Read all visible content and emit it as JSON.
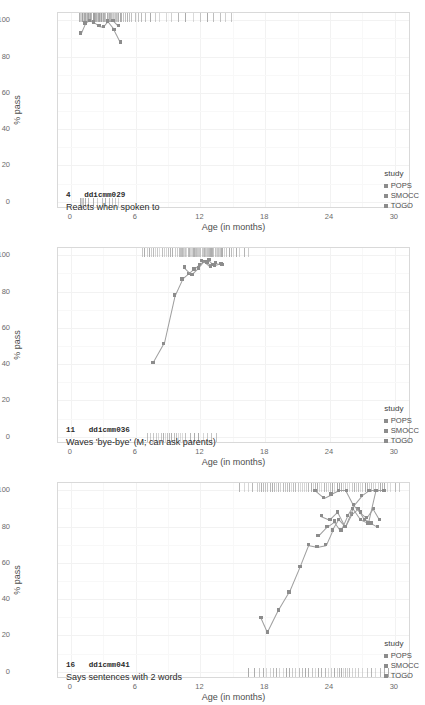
{
  "axes": {
    "ylabel": "% pass",
    "xlabel": "Age (in months)",
    "yticks": [
      "0",
      "20",
      "40",
      "60",
      "80",
      "100"
    ],
    "xticks": [
      "0",
      "6",
      "12",
      "18",
      "24",
      "30"
    ],
    "ylim": [
      -4,
      104
    ],
    "xlim": [
      -1.2,
      31.5
    ]
  },
  "legend": {
    "title": "study",
    "items": [
      {
        "label": "POPS",
        "color": "#8c8c8c"
      },
      {
        "label": "SMOCC",
        "color": "#8c8c8c"
      },
      {
        "label": "TOGO",
        "color": "#8c8c8c"
      }
    ]
  },
  "chart_data": {
    "type": "line",
    "title": "",
    "xlabel": "Age (in months)",
    "ylabel": "% pass",
    "xlim": [
      -1.2,
      31.5
    ],
    "ylim": [
      -4,
      104
    ],
    "grid": true,
    "legend_position": "bottom-right",
    "panels": [
      {
        "number": "4",
        "code": "ddicmm029",
        "description": "Reacts when spoken to",
        "series": [
          {
            "name": "SMOCC",
            "x": [
              0.9,
              1.3,
              1.7,
              2.1,
              2.6,
              3.0,
              3.4,
              3.9,
              4.4
            ],
            "y": [
              93.0,
              98.5,
              100.0,
              99.0,
              97.0,
              96.5,
              99.5,
              100.0,
              97.0
            ]
          },
          {
            "name": "SMOCC",
            "x": [
              3.4,
              4.0,
              4.6
            ],
            "y": [
              99.5,
              95.0,
              88.0
            ]
          }
        ],
        "rug_top": [
          0.7,
          0.8,
          0.9,
          1.0,
          1.0,
          1.1,
          1.2,
          1.2,
          1.3,
          1.3,
          1.4,
          1.5,
          1.5,
          1.6,
          1.6,
          1.7,
          1.8,
          1.8,
          1.9,
          2.0,
          2.0,
          2.1,
          2.1,
          2.2,
          2.3,
          2.3,
          2.4,
          2.5,
          2.5,
          2.6,
          2.6,
          2.7,
          2.8,
          2.8,
          2.9,
          3.0,
          3.0,
          3.1,
          3.1,
          3.2,
          3.3,
          3.3,
          3.4,
          3.5,
          3.5,
          3.6,
          3.7,
          3.8,
          3.9,
          4.0,
          4.1,
          4.2,
          4.3,
          4.4,
          4.5,
          4.6,
          4.8,
          5.0,
          5.2,
          5.4,
          5.6,
          5.9,
          6.2,
          6.5,
          6.9,
          7.3,
          7.8,
          8.2,
          8.8,
          9.3,
          9.9,
          10.6,
          11.3,
          12.0,
          12.6,
          13.2,
          13.8,
          14.3,
          14.8
        ],
        "rug_bottom": [
          0.8,
          0.9,
          1.0,
          1.1,
          1.3,
          1.6,
          2.0,
          2.4,
          2.9,
          3.2,
          3.5,
          3.8,
          4.1,
          4.4
        ]
      },
      {
        "number": "11",
        "code": "ddicmm036",
        "description": "Waves 'bye-bye' (M; can ask parents)",
        "series": [
          {
            "name": "SMOCC",
            "x": [
              7.6,
              8.6,
              9.6,
              10.3,
              10.9,
              11.4,
              11.9,
              12.4,
              12.9,
              13.4,
              14.0
            ],
            "y": [
              41.0,
              51.5,
              78.0,
              87.0,
              90.0,
              92.5,
              95.0,
              96.5,
              94.0,
              96.0,
              95.0
            ]
          },
          {
            "name": "SMOCC",
            "x": [
              10.5,
              11.2,
              11.8,
              12.3,
              12.8,
              13.3,
              13.9
            ],
            "y": [
              93.5,
              89.5,
              93.0,
              96.5,
              97.5,
              94.5,
              95.5
            ]
          },
          {
            "name": "SMOCC",
            "x": [
              12.1,
              12.6,
              13.1
            ],
            "y": [
              97.0,
              96.0,
              95.0
            ]
          }
        ],
        "rug_top": [
          6.6,
          6.8,
          7.0,
          7.2,
          7.4,
          7.6,
          7.8,
          8.0,
          8.2,
          8.4,
          8.6,
          8.8,
          9.0,
          9.2,
          9.4,
          9.6,
          9.8,
          10.0,
          10.1,
          10.2,
          10.3,
          10.4,
          10.5,
          10.6,
          10.7,
          10.8,
          10.9,
          11.0,
          11.1,
          11.2,
          11.3,
          11.4,
          11.5,
          11.6,
          11.7,
          11.8,
          11.9,
          12.0,
          12.1,
          12.2,
          12.3,
          12.4,
          12.5,
          12.6,
          12.7,
          12.8,
          12.9,
          13.0,
          13.1,
          13.2,
          13.3,
          13.4,
          13.5,
          13.6,
          13.7,
          13.8,
          13.9,
          14.0,
          14.2,
          14.4,
          14.6,
          14.8,
          15.0,
          15.3,
          15.6,
          16.0,
          16.4
        ],
        "rug_bottom": [
          7.0,
          7.3,
          7.6,
          7.9,
          8.1,
          8.3,
          8.5,
          8.7,
          8.9,
          9.1,
          9.3,
          9.5,
          9.7,
          9.9,
          10.1,
          10.3,
          10.6,
          11.0,
          11.4,
          11.8,
          12.2,
          12.6,
          13.0,
          13.4
        ]
      },
      {
        "number": "16",
        "code": "ddicmm041",
        "description": "Says sentences with 2 words",
        "series": [
          {
            "name": "SMOCC",
            "x": [
              17.6,
              18.2,
              19.2,
              20.2,
              21.2,
              22.0,
              22.8,
              23.6,
              24.2,
              24.8,
              25.4,
              26.0,
              26.6,
              27.2,
              27.8,
              28.4
            ],
            "y": [
              30.0,
              22.0,
              34.0,
              44.0,
              58.0,
              70.0,
              69.0,
              70.0,
              78.0,
              84.0,
              80.0,
              87.0,
              90.0,
              84.0,
              82.0,
              80.0
            ]
          },
          {
            "name": "POPS",
            "x": [
              22.9,
              23.7,
              24.4,
              25.0,
              25.6,
              26.2,
              26.8,
              27.4,
              28.0,
              28.6
            ],
            "y": [
              75.0,
              80.0,
              83.0,
              78.0,
              86.0,
              92.0,
              88.0,
              85.0,
              90.0,
              84.0
            ]
          },
          {
            "name": "TOGO",
            "x": [
              22.6,
              23.4,
              24.1,
              24.8,
              25.5,
              26.2,
              26.9,
              27.6,
              28.3,
              29.0
            ],
            "y": [
              100.0,
              96.0,
              98.0,
              100.0,
              100.0,
              92.0,
              97.0,
              100.0,
              100.0,
              100.0
            ]
          },
          {
            "name": "TOGO",
            "x": [
              23.2,
              24.0,
              24.7,
              25.4,
              26.1,
              26.8,
              27.5,
              28.2
            ],
            "y": [
              86.0,
              84.0,
              88.0,
              80.0,
              90.0,
              84.0,
              82.0,
              100.0
            ]
          }
        ],
        "rug_top": [
          15.6,
          16.0,
          16.4,
          16.8,
          17.2,
          17.4,
          17.6,
          17.8,
          18.0,
          18.2,
          18.4,
          18.6,
          18.8,
          19.0,
          19.2,
          19.4,
          19.6,
          19.8,
          20.0,
          20.2,
          20.4,
          20.6,
          20.8,
          21.0,
          21.2,
          21.4,
          21.6,
          21.8,
          22.0,
          22.2,
          22.4,
          22.6,
          22.8,
          23.0,
          23.2,
          23.4,
          23.6,
          23.8,
          24.0,
          24.2,
          24.4,
          24.6,
          24.8,
          25.0,
          25.2,
          25.4,
          25.6,
          25.8,
          26.0,
          26.2,
          26.4,
          26.6,
          26.8,
          27.0,
          27.2,
          27.4,
          27.6,
          27.8,
          28.0,
          28.2,
          28.4,
          28.6,
          28.8,
          29.0,
          29.3,
          29.6,
          30.0,
          30.4
        ],
        "rug_bottom": [
          16.4,
          17.0,
          17.4,
          17.8,
          18.1,
          18.4,
          18.7,
          19.0,
          19.3,
          19.6,
          19.9,
          20.2,
          20.5,
          20.8,
          21.1,
          21.4,
          21.7,
          22.0,
          22.3,
          22.6,
          22.9,
          23.2,
          23.5,
          23.8,
          24.1,
          24.4,
          24.6,
          24.8,
          25.0,
          25.2,
          25.4,
          25.6,
          25.8,
          26.0,
          26.3,
          26.6,
          27.0,
          27.4,
          27.8,
          28.2,
          28.6,
          29.0,
          29.4
        ]
      }
    ]
  }
}
